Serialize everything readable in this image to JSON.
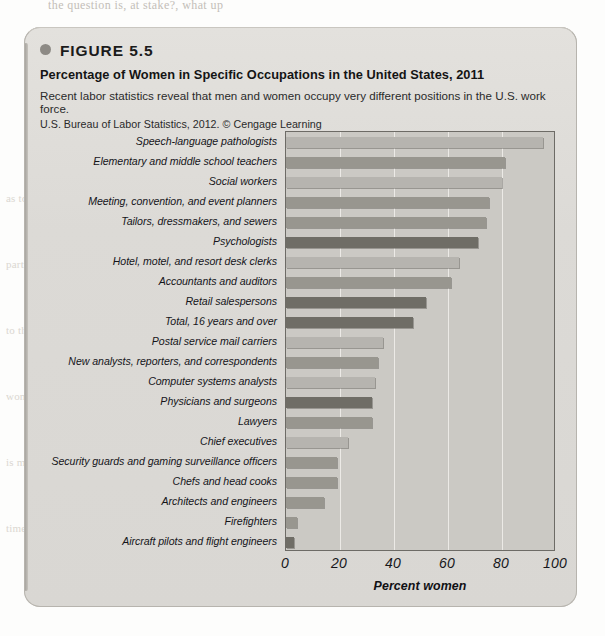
{
  "page": {
    "bleed_text": "the question is, at stake?, what up"
  },
  "ghost_lines": [
    "as to proportion of women in certain",
    "occupations and even more than in",
    "particular the numbers of women",
    "than they in the work. Comparing",
    "to the socialization of occupations",
    "so much above the gender and how",
    "women often in the pay gap that",
    "the mean pay of men and women",
    "is much more than half a century",
    "additional to see that many",
    "times for women"
  ],
  "figure": {
    "number_label": "FIGURE 5.5",
    "title": "Percentage of Women in Specific Occupations in the United States, 2011",
    "description": "Recent labor statistics reveal that men and women occupy very different positions in the U.S. work force.",
    "source": "U.S. Bureau of Labor Statistics, 2012. © Cengage Learning"
  },
  "chart_data": {
    "type": "bar",
    "orientation": "horizontal",
    "title": "Percentage of Women in Specific Occupations in the United States, 2011",
    "xlabel": "Percent women",
    "ylabel": "",
    "xlim": [
      0,
      100
    ],
    "xticks": [
      0,
      20,
      40,
      60,
      80,
      100
    ],
    "grid": true,
    "legend": false,
    "categories": [
      "Speech-language pathologists",
      "Elementary and middle school teachers",
      "Social workers",
      "Meeting, convention, and event planners",
      "Tailors, dressmakers, and sewers",
      "Psychologists",
      "Hotel, motel, and resort desk clerks",
      "Accountants and auditors",
      "Retail salespersons",
      "Total, 16 years and over",
      "Postal service mail carriers",
      "New analysts, reporters, and correspondents",
      "Computer systems analysts",
      "Physicians and surgeons",
      "Lawyers",
      "Chief executives",
      "Security guards and gaming surveillance officers",
      "Chefs and head cooks",
      "Architects and engineers",
      "Firefighters",
      "Aircraft pilots and flight engineers"
    ],
    "values": [
      95,
      81,
      80,
      75,
      74,
      71,
      64,
      61,
      52,
      47,
      36,
      34,
      33,
      32,
      32,
      23,
      19,
      19,
      14,
      4,
      3
    ],
    "bar_shades": [
      "light",
      "mid",
      "light",
      "mid",
      "mid",
      "dark",
      "light",
      "mid",
      "dark",
      "dark",
      "light",
      "mid",
      "light",
      "dark",
      "mid",
      "light",
      "mid",
      "mid",
      "mid",
      "mid",
      "dark"
    ],
    "colors": {
      "light": "#b6b4af",
      "mid": "#98968f",
      "dark": "#6f6d66",
      "plot_background": "#cbc9c4",
      "panel_background": "#dcdad6",
      "gridline": "#eceae6",
      "axis": "#6d6b66"
    }
  }
}
